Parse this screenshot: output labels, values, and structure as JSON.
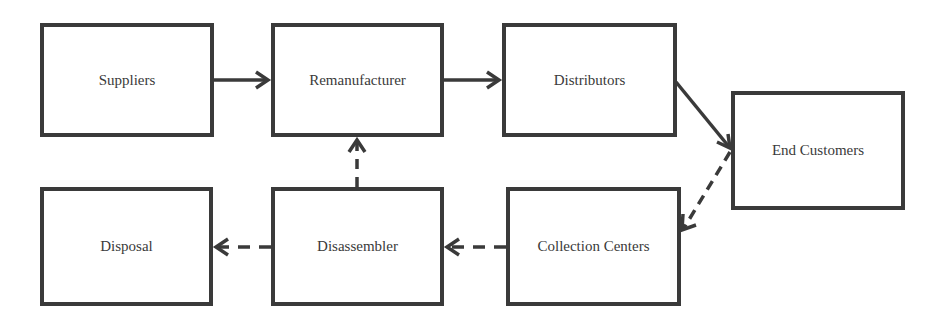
{
  "diagram": {
    "nodes": [
      {
        "id": "suppliers",
        "label": "Suppliers"
      },
      {
        "id": "remanufacturer",
        "label": "Remanufacturer"
      },
      {
        "id": "distributors",
        "label": "Distributors"
      },
      {
        "id": "end_customers",
        "label": "End Customers"
      },
      {
        "id": "collection_centers",
        "label": "Collection Centers"
      },
      {
        "id": "disassembler",
        "label": "Disassembler"
      },
      {
        "id": "disposal",
        "label": "Disposal"
      }
    ],
    "edges": [
      {
        "from": "suppliers",
        "to": "remanufacturer",
        "style": "solid"
      },
      {
        "from": "remanufacturer",
        "to": "distributors",
        "style": "solid"
      },
      {
        "from": "distributors",
        "to": "end_customers",
        "style": "solid"
      },
      {
        "from": "end_customers",
        "to": "collection_centers",
        "style": "dashed"
      },
      {
        "from": "collection_centers",
        "to": "disassembler",
        "style": "dashed"
      },
      {
        "from": "disassembler",
        "to": "disposal",
        "style": "dashed"
      },
      {
        "from": "disassembler",
        "to": "remanufacturer",
        "style": "dashed"
      }
    ],
    "colors": {
      "stroke": "#3a3a3a",
      "background": "#ffffff"
    }
  }
}
